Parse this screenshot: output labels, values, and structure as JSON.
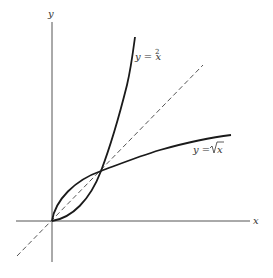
{
  "figure": {
    "axes": {
      "x_label": "x",
      "y_label": "y"
    },
    "curves": [
      {
        "name": "parabola",
        "label_base": "y = x",
        "label_sup": "2",
        "equation": "y=x^2",
        "style": "solid"
      },
      {
        "name": "sqrt",
        "label_base": "y = ",
        "label_rad": "x",
        "equation": "y=sqrt(x)",
        "style": "solid"
      },
      {
        "name": "identity",
        "equation": "y=x",
        "style": "dashed"
      }
    ],
    "intersection_points": [
      [
        0,
        0
      ],
      [
        1,
        1
      ]
    ],
    "colors": {
      "curve": "#1a1a1a",
      "axis": "#555555",
      "dashed": "#555555",
      "text": "#333333",
      "background": "#ffffff"
    }
  }
}
